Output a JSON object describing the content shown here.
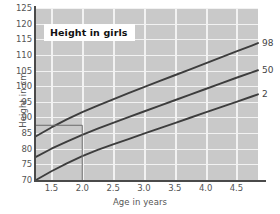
{
  "chart_data": {
    "type": "line",
    "title": "Height in girls",
    "xlabel": "Age in years",
    "ylabel": "Height in cm",
    "xlim": [
      1.25,
      4.85
    ],
    "ylim": [
      70,
      125
    ],
    "xticks": [
      "1.5",
      "2.0",
      "2.5",
      "3.0",
      "3.5",
      "4.0",
      "4.5"
    ],
    "xtick_values": [
      1.5,
      2.0,
      2.5,
      3.0,
      3.5,
      4.0,
      4.5
    ],
    "yticks": [
      "70",
      "75",
      "80",
      "85",
      "90",
      "95",
      "100",
      "105",
      "110",
      "115",
      "120",
      "125"
    ],
    "ytick_values": [
      70,
      75,
      80,
      85,
      90,
      95,
      100,
      105,
      110,
      115,
      120,
      125
    ],
    "grid": true,
    "legend_position": "right-inline",
    "series": [
      {
        "name": "98",
        "label": "98",
        "x": [
          1.25,
          1.5,
          1.75,
          2.0,
          2.25,
          2.5,
          2.75,
          3.0,
          3.25,
          3.5,
          3.75,
          4.0,
          4.25,
          4.5,
          4.75,
          4.85
        ],
        "values": [
          84.0,
          86.8,
          89.4,
          91.7,
          93.8,
          95.8,
          97.8,
          99.7,
          101.6,
          103.5,
          105.4,
          107.3,
          109.2,
          111.1,
          113.0,
          113.8
        ]
      },
      {
        "name": "50",
        "label": "50",
        "x": [
          1.25,
          1.5,
          1.75,
          2.0,
          2.25,
          2.5,
          2.75,
          3.0,
          3.25,
          3.5,
          3.75,
          4.0,
          4.25,
          4.5,
          4.75,
          4.85
        ],
        "values": [
          77.4,
          80.0,
          82.3,
          84.4,
          86.4,
          88.3,
          90.1,
          91.9,
          93.7,
          95.5,
          97.3,
          99.1,
          100.9,
          102.7,
          104.4,
          105.1
        ]
      },
      {
        "name": "2",
        "label": "2",
        "x": [
          1.25,
          1.5,
          1.75,
          2.0,
          2.25,
          2.5,
          2.75,
          3.0,
          3.25,
          3.5,
          3.75,
          4.0,
          4.25,
          4.5,
          4.75,
          4.85
        ],
        "values": [
          70.0,
          72.8,
          75.3,
          77.6,
          79.6,
          81.4,
          83.1,
          84.8,
          86.5,
          88.2,
          89.9,
          91.6,
          93.3,
          95.0,
          96.7,
          97.4
        ]
      }
    ],
    "annotations": [
      {
        "name": "reference-lines",
        "description": "horizontal line at 87.5 cm meeting vertical line at age 2.0",
        "height_cm": 87.5,
        "age_years": 2.0
      }
    ]
  }
}
